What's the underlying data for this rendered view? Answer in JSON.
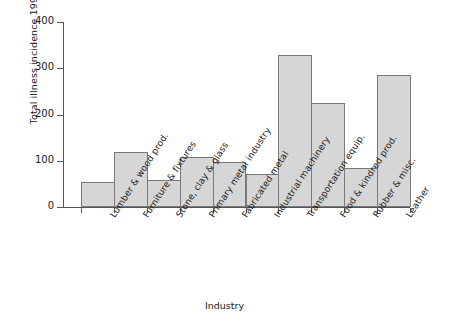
{
  "chart_data": {
    "type": "bar",
    "title": "",
    "xlabel": "Industry",
    "ylabel": "Total illness incidence 1999",
    "categories": [
      "Lumber & wood prod.",
      "Furniture & fixtures",
      "Stone, clay & glass",
      "Primary metal industry",
      "Fabricated metal",
      "Industrial machinery",
      "Transportation equip.",
      "Food & kindred prod.",
      "Rubber & misc.",
      "Leather"
    ],
    "values": [
      55,
      119,
      58,
      108,
      98,
      71,
      329,
      224,
      85,
      285
    ],
    "ylim": [
      0,
      400
    ],
    "yticks": [
      0,
      100,
      200,
      300,
      400
    ],
    "ytick_labels": [
      "0",
      "100",
      "200",
      "300",
      "400"
    ],
    "grid": false,
    "legend": null,
    "bar_fill_color": "#d6d6d6",
    "bar_edge_color": "#7a7a7a",
    "axis_color": "#555555",
    "background_color": "#ffffff"
  }
}
